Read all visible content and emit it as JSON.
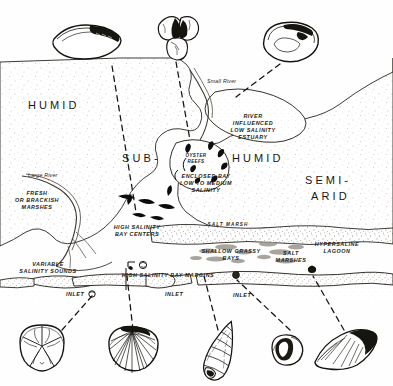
{
  "figure": {
    "kind": "hand-drawn pen-and-ink coastal environment map",
    "background_color": "#fefefe",
    "ink_color": "#1a1814"
  },
  "climate_zones": [
    {
      "id": "humid-left",
      "label": "HUMID",
      "x": 28,
      "y": 99
    },
    {
      "id": "sub",
      "label": "SUB-",
      "x": 122,
      "y": 152
    },
    {
      "id": "humid-right",
      "label": "HUMID",
      "x": 232,
      "y": 152
    },
    {
      "id": "semi",
      "label": "SEMI-",
      "x": 305,
      "y": 174
    },
    {
      "id": "arid",
      "label": "ARID",
      "x": 311,
      "y": 190
    }
  ],
  "environments": [
    {
      "id": "river-influenced-estuary",
      "lines": [
        "RIVER",
        "INFLUENCED",
        "LOW SALINITY",
        "ESTUARY"
      ],
      "x": 253,
      "y": 113,
      "style": "envcaps"
    },
    {
      "id": "oyster-reefs",
      "lines": [
        "OYSTER",
        "REEFS"
      ],
      "x": 196,
      "y": 153,
      "style": "envsm"
    },
    {
      "id": "enclosed-bay",
      "lines": [
        "ENCLOSED BAY",
        "LOW TO MEDIUM",
        "SALINITY"
      ],
      "x": 206,
      "y": 173,
      "style": "envcaps"
    },
    {
      "id": "fresh-or-brackish-marshes",
      "lines": [
        "FRESH",
        "OR BRACKISH",
        "MARSHES"
      ],
      "x": 37,
      "y": 190,
      "style": "envcaps"
    },
    {
      "id": "high-salinity-bay-centers",
      "lines": [
        "HIGH SALINITY",
        "BAY CENTERS"
      ],
      "x": 137,
      "y": 224,
      "style": "envcaps"
    },
    {
      "id": "variable-salinity-sounds",
      "lines": [
        "VARIABLE",
        "SALINITY SOUNDS"
      ],
      "x": 48,
      "y": 261,
      "style": "envcaps"
    },
    {
      "id": "shallow-grassy-bays",
      "lines": [
        "SHALLOW GRASSY",
        "BAYS"
      ],
      "x": 231,
      "y": 248,
      "style": "envcaps"
    },
    {
      "id": "salt-marshes",
      "lines": [
        "SALT",
        "MARSHES"
      ],
      "x": 291,
      "y": 250,
      "style": "envcaps"
    },
    {
      "id": "hypersaline-lagoon",
      "lines": [
        "HYPERSALINE",
        "LAGOON",
        ""
      ],
      "x": 337,
      "y": 241,
      "style": "envcaps"
    },
    {
      "id": "high-salinity-bay-margins",
      "lines": [
        "HIGH   SALINITY   BAY  MARGINS"
      ],
      "x": 168,
      "y": 272,
      "style": "envcaps"
    }
  ],
  "water_labels": [
    {
      "id": "large-river",
      "label": "Large River",
      "x": 28,
      "y": 172
    },
    {
      "id": "small-river",
      "label": "Small River",
      "x": 207,
      "y": 78
    }
  ],
  "marsh_band_label": {
    "id": "salt-marsh-band",
    "label": "SALT  MARSH",
    "x": 228,
    "y": 222
  },
  "inlets": [
    {
      "id": "inlet-west",
      "label": "INLET",
      "x": 66,
      "y": 291
    },
    {
      "id": "inlet-center",
      "label": "INLET",
      "x": 165,
      "y": 291
    },
    {
      "id": "inlet-east",
      "label": "INLET",
      "x": 233,
      "y": 292
    }
  ],
  "specimens": [
    {
      "id": "specimen-mussel",
      "name": "curved-mussel-shell",
      "row": "top",
      "x": 88,
      "y": 45
    },
    {
      "id": "specimen-oyster",
      "name": "oyster-cluster",
      "row": "top",
      "x": 179,
      "y": 38
    },
    {
      "id": "specimen-clam-interior",
      "name": "clam-shell-interior",
      "row": "top",
      "x": 290,
      "y": 42
    },
    {
      "id": "specimen-sand-dollar",
      "name": "sand-dollar",
      "row": "bottom",
      "x": 42,
      "y": 348
    },
    {
      "id": "specimen-cockle",
      "name": "cockle-scallop-shell",
      "row": "bottom",
      "x": 133,
      "y": 349
    },
    {
      "id": "specimen-turret-snail",
      "name": "turret-snail-shell",
      "row": "bottom",
      "x": 222,
      "y": 350
    },
    {
      "id": "specimen-small-bivalve",
      "name": "small-round-bivalve",
      "row": "bottom",
      "x": 287,
      "y": 350
    },
    {
      "id": "specimen-wedge-clam",
      "name": "wedge-clam-shell",
      "row": "bottom",
      "x": 345,
      "y": 352
    }
  ],
  "leader_lines": [
    {
      "id": "leader-mussel-to-bay-centers",
      "from": "specimen-mussel",
      "to": "high-salinity-bay-centers"
    },
    {
      "id": "leader-oyster-to-reefs",
      "from": "specimen-oyster",
      "to": "oyster-reefs"
    },
    {
      "id": "leader-clam-to-estuary",
      "from": "specimen-clam-interior",
      "to": "river-influenced-estuary"
    },
    {
      "id": "leader-sanddollar-to-inlet",
      "from": "specimen-sand-dollar",
      "to": "inlet-west"
    },
    {
      "id": "leader-cockle-to-bay-margins",
      "from": "specimen-cockle",
      "to": "high-salinity-bay-margins"
    },
    {
      "id": "leader-snail-to-grassy-bays",
      "from": "specimen-turret-snail",
      "to": "shallow-grassy-bays"
    },
    {
      "id": "leader-bivalve-to-marshes",
      "from": "specimen-small-bivalve",
      "to": "salt-marshes"
    },
    {
      "id": "leader-wedge-to-lagoon",
      "from": "specimen-wedge-clam",
      "to": "hypersaline-lagoon"
    }
  ]
}
